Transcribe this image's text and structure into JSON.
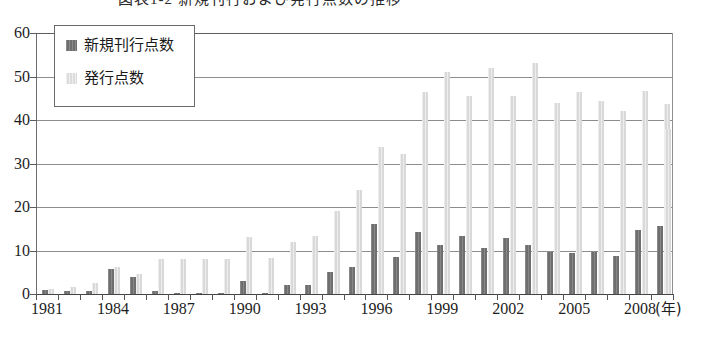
{
  "figure": {
    "caption_partial": "図表1-2 新規刊行および発行点数の推移",
    "caption_visible": false
  },
  "legend": {
    "position": "inside-top-left",
    "entries": [
      {
        "label": "新規刊行点数",
        "swatch": "dark",
        "color": "#6e6e6e"
      },
      {
        "label": "発行点数",
        "swatch": "light",
        "color": "#d9d9d9"
      }
    ]
  },
  "axes": {
    "y": {
      "ticks": [
        "60",
        "50",
        "40",
        "30",
        "20",
        "10",
        "0"
      ],
      "min": 0,
      "max": 60,
      "step": 10
    },
    "x": {
      "labels": [
        "1981",
        "1984",
        "1987",
        "1990",
        "1993",
        "1996",
        "1999",
        "2002",
        "2005",
        "2008"
      ],
      "unit": "(年)"
    }
  },
  "chart_data": {
    "type": "bar",
    "title": "図表1-2 新規刊行および発行点数の推移",
    "xlabel": "(年)",
    "ylabel": "",
    "ylim": [
      0,
      60
    ],
    "grid": true,
    "legend_position": "upper left (inside plot)",
    "categories": [
      "1981",
      "1982",
      "1983",
      "1984",
      "1985",
      "1986",
      "1987",
      "1988",
      "1989",
      "1990",
      "1991",
      "1992",
      "1993",
      "1994",
      "1995",
      "1996",
      "1997",
      "1998",
      "1999",
      "2000",
      "2001",
      "2002",
      "2003",
      "2004",
      "2005",
      "2006",
      "2007",
      "2008",
      "2009"
    ],
    "series": [
      {
        "name": "新規刊行点数",
        "color": "#6e6e6e",
        "values": [
          1.0,
          0.8,
          0.8,
          5.7,
          4.0,
          0.8,
          0.3,
          0.3,
          0.3,
          3.0,
          0.3,
          2.0,
          2.0,
          5.0,
          6.2,
          16.1,
          8.4,
          14.3,
          11.2,
          13.3,
          10.5,
          12.8,
          11.3,
          9.6,
          9.5,
          9.7,
          8.8,
          14.8,
          15.7
        ]
      },
      {
        "name": "発行点数",
        "color": "#d9d9d9",
        "values": [
          1.2,
          1.6,
          2.6,
          6.2,
          4.6,
          8.0,
          8.0,
          8.0,
          8.0,
          13.2,
          8.3,
          12.0,
          13.3,
          19.0,
          24.0,
          33.7,
          32.2,
          46.4,
          51.0,
          45.6,
          52.0,
          45.6,
          53.1,
          43.8,
          46.5,
          44.3,
          42.0,
          46.6,
          43.6
        ]
      }
    ],
    "trailing_value": {
      "category": "2009 (right edge)",
      "series": "発行点数",
      "value": 37.9
    }
  }
}
